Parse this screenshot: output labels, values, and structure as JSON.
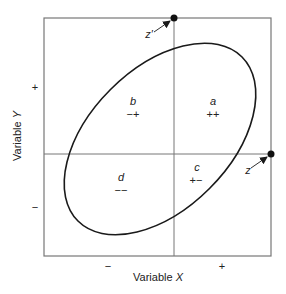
{
  "diagram": {
    "x_axis": {
      "label": "Variable",
      "var": "X",
      "ticks": {
        "negative": "−",
        "positive": "+"
      }
    },
    "y_axis": {
      "label": "Variable",
      "var": "Y",
      "ticks": {
        "negative": "−",
        "positive": "+"
      }
    },
    "quadrants": [
      {
        "name": "a",
        "signs": "++"
      },
      {
        "name": "b",
        "signs": "−+"
      },
      {
        "name": "c",
        "signs": "+−"
      },
      {
        "name": "d",
        "signs": "−−"
      }
    ],
    "points": [
      {
        "label": "z′"
      },
      {
        "label": "z"
      }
    ],
    "colors": {
      "frame": "#777777",
      "ellipse": "#1a1a1a",
      "text": "#222222"
    }
  }
}
